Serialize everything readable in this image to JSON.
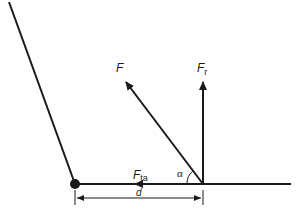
{
  "diagram": {
    "type": "force-diagram",
    "colors": {
      "line": "#1a1a1a",
      "background": "#ffffff"
    },
    "labels": {
      "force": "F",
      "radial_force": "F",
      "radial_sub": "r",
      "tangential_force": "F",
      "tangential_sub": "ta",
      "angle": "α",
      "distance": "d"
    },
    "elements": [
      {
        "name": "lever-arm-slanted",
        "from": [
          9,
          2
        ],
        "to": [
          75,
          184
        ]
      },
      {
        "name": "baseline",
        "from": [
          75,
          184
        ],
        "to": [
          291,
          184
        ]
      },
      {
        "name": "pivot-point",
        "at": [
          75,
          184
        ]
      },
      {
        "name": "force-F-arrow",
        "from": [
          203,
          184
        ],
        "to": [
          124,
          80
        ]
      },
      {
        "name": "force-Fr-arrow",
        "from": [
          203,
          184
        ],
        "to": [
          203,
          80
        ]
      },
      {
        "name": "force-Fta-arrow",
        "direction": "left",
        "head_at": [
          138,
          184
        ]
      },
      {
        "name": "angle-alpha-arc",
        "center": [
          203,
          184
        ]
      },
      {
        "name": "distance-d-dimension",
        "from": [
          75,
          198
        ],
        "to": [
          203,
          198
        ]
      }
    ]
  }
}
